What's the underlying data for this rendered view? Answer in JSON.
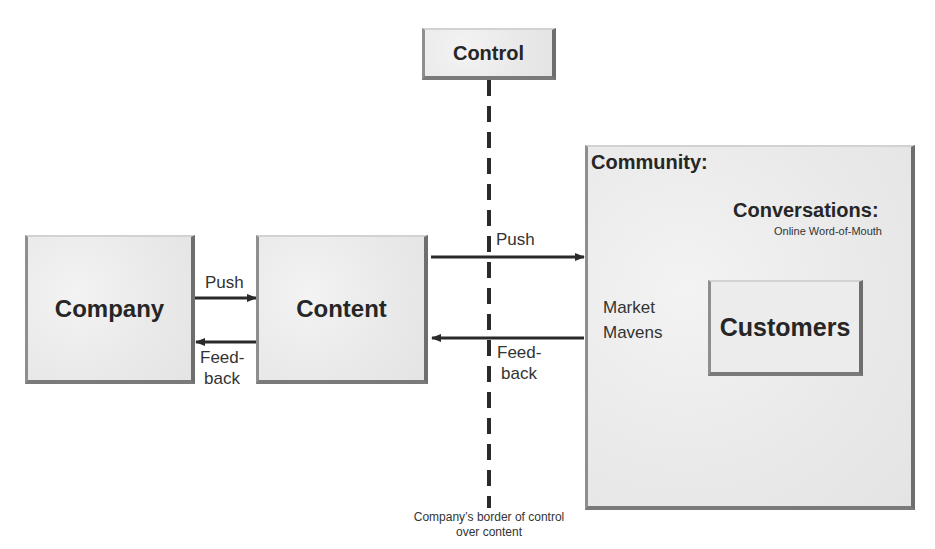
{
  "diagram": {
    "nodes": {
      "control": {
        "label": "Control"
      },
      "company": {
        "label": "Company"
      },
      "content": {
        "label": "Content"
      },
      "community": {
        "label": "Community:"
      },
      "conversations": {
        "label": "Conversations:",
        "sublabel": "Online Word-of-Mouth"
      },
      "market_mavens": {
        "line1": "Market",
        "line2": "Mavens"
      },
      "customers": {
        "label": "Customers"
      }
    },
    "edges": {
      "company_to_content": {
        "label": "Push"
      },
      "content_to_company": {
        "line1": "Feed-",
        "line2": "back"
      },
      "content_to_community": {
        "label": "Push"
      },
      "community_to_content": {
        "line1": "Feed-",
        "line2": "back"
      }
    },
    "border_caption": {
      "line1": "Company’s border of control",
      "line2": "over content"
    },
    "colors": {
      "box_fill": "#eeeeee",
      "line": "#2a2a2a",
      "text": "#262626"
    }
  }
}
